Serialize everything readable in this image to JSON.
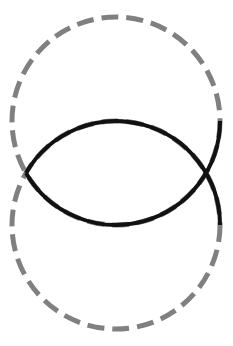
{
  "diagram": {
    "type": "two-overlapping-circles",
    "background": "#ffffff",
    "circles": [
      {
        "name": "upper-circle",
        "cx": 116,
        "cy": 121,
        "r": 104
      },
      {
        "name": "lower-circle",
        "cx": 116,
        "cy": 225,
        "r": 104
      }
    ],
    "intersections": [
      {
        "x": 26,
        "y": 173
      },
      {
        "x": 206,
        "y": 173
      }
    ],
    "styles": {
      "dashed": {
        "color": "#808080",
        "width": 5,
        "dash": "17 8"
      },
      "solid": {
        "color": "#111111",
        "width": 4
      }
    },
    "highlighted_path": "upper circle from rightmost point through bottom to left intersection; lower circle from left intersection through top to rightmost point"
  }
}
